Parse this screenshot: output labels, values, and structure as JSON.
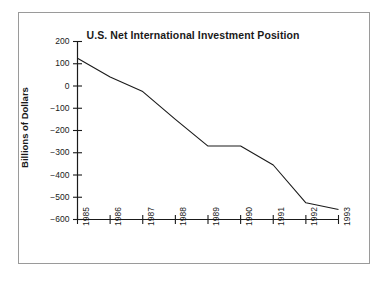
{
  "chart_data": {
    "type": "line",
    "title": "U.S. Net International Investment Position",
    "xlabel": "",
    "ylabel": "Billions of Dollars",
    "categories": [
      "1985",
      "1986",
      "1987",
      "1988",
      "1989",
      "1990",
      "1991",
      "1992",
      "1993"
    ],
    "x": [
      1985,
      1986,
      1987,
      1988,
      1989,
      1990,
      1991,
      1992,
      1993
    ],
    "values": [
      125,
      40,
      -25,
      -150,
      -270,
      -270,
      -355,
      -525,
      -555
    ],
    "series": [
      {
        "name": "U.S. Net International Investment Position",
        "values": [
          125,
          40,
          -25,
          -150,
          -270,
          -270,
          -355,
          -525,
          -555
        ]
      }
    ],
    "ylim": [
      -600,
      200
    ],
    "yticks": [
      200,
      100,
      0,
      -100,
      -200,
      -300,
      -400,
      -500,
      -600
    ],
    "ytick_labels": [
      "200",
      "100",
      "0",
      "−100",
      "−200",
      "−300",
      "−400",
      "−500",
      "−600"
    ],
    "xtick_labels": [
      "1985",
      "1986",
      "1987",
      "1988",
      "1989",
      "1990",
      "1991",
      "1992",
      "1993"
    ],
    "grid": false,
    "legend": false,
    "legend_position": "none",
    "line_color": "#1a1a1a",
    "axis_color": "#1a1a1a",
    "background_color": "#ffffff",
    "frame_color": "#9a9a9a"
  }
}
